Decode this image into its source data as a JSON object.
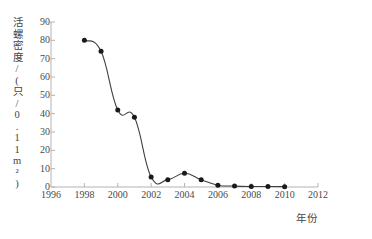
{
  "chart_data": {
    "type": "line",
    "title": "",
    "xlabel": "年份",
    "ylabel": "活螺密度/(只/0.11m²)",
    "x": [
      1998,
      1999,
      2000,
      2001,
      2002,
      2003,
      2004,
      2005,
      2006,
      2007,
      2008,
      2009,
      2010
    ],
    "values": [
      80,
      74,
      42,
      38,
      5.5,
      4,
      7.5,
      4,
      1,
      0.5,
      0.3,
      0.3,
      0.2
    ],
    "series": [
      {
        "name": "活螺密度",
        "values": [
          80,
          74,
          42,
          38,
          5.5,
          4,
          7.5,
          4,
          1,
          0.5,
          0.3,
          0.3,
          0.2
        ]
      }
    ],
    "xlim": [
      1996,
      2012
    ],
    "ylim": [
      0,
      90
    ],
    "xticks": [
      1996,
      1998,
      2000,
      2002,
      2004,
      2006,
      2008,
      2010,
      2012
    ],
    "xtick_labels": [
      "1996",
      "1998",
      "2000",
      "2002",
      "2004",
      "2006",
      "2008",
      "2010",
      "2012"
    ],
    "yticks": [
      0,
      10,
      20,
      30,
      40,
      50,
      60,
      70,
      80,
      90
    ],
    "ytick_labels": [
      "0",
      "10",
      "20",
      "30",
      "40",
      "50",
      "60",
      "70",
      "80",
      "90"
    ],
    "grid": false,
    "legend": false,
    "legend_position": "none",
    "marker": "circle",
    "line_color": "#404040",
    "marker_color": "#1a1a1a",
    "axis_color": "#b0b0b0",
    "background_color": "#ffffff"
  }
}
